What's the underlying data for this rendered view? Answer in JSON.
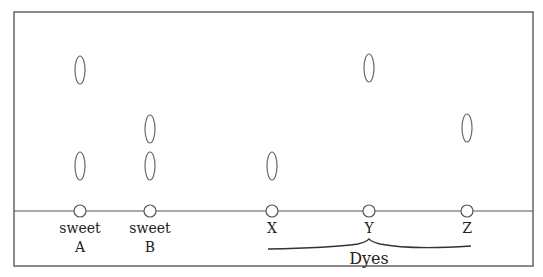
{
  "diagram": {
    "type": "paper-chromatogram",
    "frame": {
      "x": 14,
      "y": 12,
      "width": 519,
      "height": 254,
      "stroke": "#666666"
    },
    "baseline": {
      "y": 211,
      "x1": 14,
      "x2": 533
    },
    "lanes": [
      {
        "id": "sweet-a",
        "label_line1": "sweet",
        "label_line2": "A",
        "x": 80,
        "spots": [
          {
            "y": 70
          },
          {
            "y": 166
          }
        ]
      },
      {
        "id": "sweet-b",
        "label_line1": "sweet",
        "label_line2": "B",
        "x": 150,
        "spots": [
          {
            "y": 129
          },
          {
            "y": 166
          }
        ]
      },
      {
        "id": "dye-x",
        "label_line1": "X",
        "label_line2": "",
        "x": 272,
        "spots": [
          {
            "y": 166
          }
        ]
      },
      {
        "id": "dye-y",
        "label_line1": "Y",
        "label_line2": "",
        "x": 369,
        "spots": [
          {
            "y": 68
          }
        ]
      },
      {
        "id": "dye-z",
        "label_line1": "Z",
        "label_line2": "",
        "x": 467,
        "spots": [
          {
            "y": 128
          }
        ]
      }
    ],
    "brace": {
      "label": "Dyes",
      "x1": 268,
      "x2": 471,
      "peak_x": 369
    }
  }
}
